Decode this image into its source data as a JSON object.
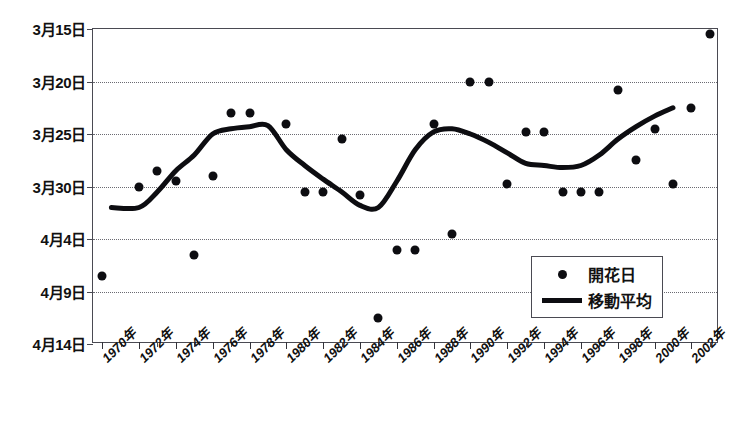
{
  "chart_data": {
    "type": "scatter",
    "title": "",
    "xlabel": "",
    "ylabel": "",
    "grid": true,
    "legend_position": "bottom-right",
    "x": [
      1970,
      1971,
      1972,
      1973,
      1974,
      1975,
      1976,
      1977,
      1978,
      1979,
      1980,
      1981,
      1982,
      1983,
      1984,
      1985,
      1986,
      1987,
      1988,
      1989,
      1990,
      1991,
      1992,
      1993,
      1994,
      1995,
      1996,
      1997,
      1998,
      1999,
      2000,
      2001,
      2002,
      2003
    ],
    "xtick_labels": [
      "1970年",
      "1972年",
      "1974年",
      "1976年",
      "1978年",
      "1980年",
      "1982年",
      "1984年",
      "1986年",
      "1988年",
      "1990年",
      "1992年",
      "1994年",
      "1996年",
      "1998年",
      "2000年",
      "2002年"
    ],
    "xtick_years": [
      1970,
      1972,
      1974,
      1976,
      1978,
      1980,
      1982,
      1984,
      1986,
      1988,
      1990,
      1992,
      1994,
      1996,
      1998,
      2000,
      2002
    ],
    "ytick_labels": [
      "3月15日",
      "3月20日",
      "3月25日",
      "3月30日",
      "4月4日",
      "4月9日",
      "4月14日"
    ],
    "ytick_values": [
      74,
      79,
      84,
      89,
      94,
      99,
      104
    ],
    "ylim": [
      74,
      104
    ],
    "xlim": [
      1969.5,
      2003.5
    ],
    "yaxis_inverted": true,
    "series": [
      {
        "name": "開花日",
        "type": "scatter",
        "marker": "circle",
        "color": "#0d0d11",
        "points": [
          {
            "year": 1970,
            "value": 97.5,
            "label": "4月6日"
          },
          {
            "year": 1972,
            "value": 89.0,
            "label": "3月30日"
          },
          {
            "year": 1973,
            "value": 87.5,
            "label": "3月28日"
          },
          {
            "year": 1974,
            "value": 88.5,
            "label": "3月29日"
          },
          {
            "year": 1975,
            "value": 95.5,
            "label": "4月1日"
          },
          {
            "year": 1976,
            "value": 88.0,
            "label": "3月29日"
          },
          {
            "year": 1977,
            "value": 82.0,
            "label": "3月22日"
          },
          {
            "year": 1978,
            "value": 82.0,
            "label": "3月22日"
          },
          {
            "year": 1980,
            "value": 83.0,
            "label": "3月23日"
          },
          {
            "year": 1981,
            "value": 89.5,
            "label": "3月30日"
          },
          {
            "year": 1982,
            "value": 89.5,
            "label": "3月30日"
          },
          {
            "year": 1983,
            "value": 84.5,
            "label": "3月24日"
          },
          {
            "year": 1984,
            "value": 89.8,
            "label": "3月30日"
          },
          {
            "year": 1985,
            "value": 101.5,
            "label": "4月11日"
          },
          {
            "year": 1986,
            "value": 95.0,
            "label": "4月1日"
          },
          {
            "year": 1987,
            "value": 95.0,
            "label": "4月1日"
          },
          {
            "year": 1988,
            "value": 83.0,
            "label": "3月23日"
          },
          {
            "year": 1989,
            "value": 93.5,
            "label": "3月31日"
          },
          {
            "year": 1990,
            "value": 79.0,
            "label": "3月20日"
          },
          {
            "year": 1991,
            "value": 79.0,
            "label": "3月20日"
          },
          {
            "year": 1992,
            "value": 88.8,
            "label": "3月30日"
          },
          {
            "year": 1993,
            "value": 83.8,
            "label": "3月24日"
          },
          {
            "year": 1994,
            "value": 83.8,
            "label": "3月24日"
          },
          {
            "year": 1995,
            "value": 89.5,
            "label": "3月30日"
          },
          {
            "year": 1996,
            "value": 89.5,
            "label": "3月30日"
          },
          {
            "year": 1997,
            "value": 89.5,
            "label": "3月30日"
          },
          {
            "year": 1998,
            "value": 79.8,
            "label": "3月21日"
          },
          {
            "year": 1999,
            "value": 86.5,
            "label": "3月27日"
          },
          {
            "year": 2000,
            "value": 83.5,
            "label": "3月24日"
          },
          {
            "year": 2001,
            "value": 88.8,
            "label": "3月30日"
          },
          {
            "year": 2002,
            "value": 81.5,
            "label": "3月22日"
          },
          {
            "year": 2003,
            "value": 74.5,
            "label": "3月15日"
          }
        ]
      },
      {
        "name": "移動平均",
        "type": "line",
        "color": "#0d0d11",
        "linewidth": 5,
        "points": [
          {
            "year": 1970.5,
            "value": 91.0
          },
          {
            "year": 1972.0,
            "value": 91.0
          },
          {
            "year": 1973.0,
            "value": 89.5
          },
          {
            "year": 1974.0,
            "value": 87.5
          },
          {
            "year": 1975.0,
            "value": 86.0
          },
          {
            "year": 1976.0,
            "value": 84.0
          },
          {
            "year": 1977.0,
            "value": 83.5
          },
          {
            "year": 1978.0,
            "value": 83.3
          },
          {
            "year": 1979.0,
            "value": 83.2
          },
          {
            "year": 1980.0,
            "value": 85.5
          },
          {
            "year": 1981.0,
            "value": 87.0
          },
          {
            "year": 1982.0,
            "value": 88.3
          },
          {
            "year": 1983.0,
            "value": 89.5
          },
          {
            "year": 1984.0,
            "value": 90.8
          },
          {
            "year": 1985.0,
            "value": 91.0
          },
          {
            "year": 1986.0,
            "value": 88.5
          },
          {
            "year": 1987.0,
            "value": 85.5
          },
          {
            "year": 1988.0,
            "value": 83.8
          },
          {
            "year": 1989.0,
            "value": 83.5
          },
          {
            "year": 1990.0,
            "value": 84.0
          },
          {
            "year": 1991.0,
            "value": 84.8
          },
          {
            "year": 1992.0,
            "value": 85.8
          },
          {
            "year": 1993.0,
            "value": 86.8
          },
          {
            "year": 1994.0,
            "value": 87.0
          },
          {
            "year": 1995.0,
            "value": 87.2
          },
          {
            "year": 1996.0,
            "value": 87.0
          },
          {
            "year": 1997.0,
            "value": 86.0
          },
          {
            "year": 1998.0,
            "value": 84.5
          },
          {
            "year": 1999.0,
            "value": 83.3
          },
          {
            "year": 2000.0,
            "value": 82.3
          },
          {
            "year": 2001.0,
            "value": 81.5
          }
        ]
      }
    ]
  },
  "legend": {
    "items": [
      {
        "key": "dot",
        "label": "開花日"
      },
      {
        "key": "line",
        "label": "移動平均"
      }
    ]
  }
}
